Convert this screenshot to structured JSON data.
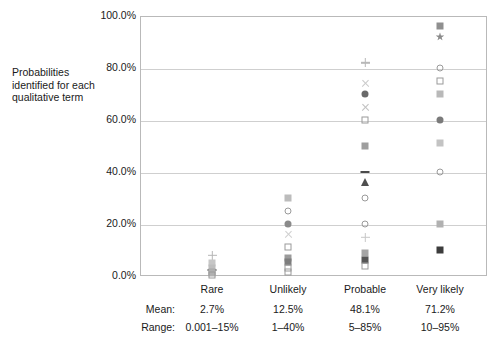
{
  "chart_data": {
    "type": "scatter",
    "title": "",
    "ylabel": "Probabilities identified for each qualitative term",
    "xlabel": "",
    "ylim": [
      0,
      100
    ],
    "yticks": [
      "0.0%",
      "20.0%",
      "40.0%",
      "60.0%",
      "80.0%",
      "100.0%"
    ],
    "ytick_values": [
      0,
      20,
      40,
      60,
      80,
      100
    ],
    "grid": true,
    "legend": "none",
    "categories": [
      "Rare",
      "Unlikely",
      "Probable",
      "Very likely"
    ],
    "series": [
      {
        "name": "Rare",
        "points": [
          {
            "value": 8.0,
            "marker": "plus",
            "color": "#b5b5b5"
          },
          {
            "value": 5.0,
            "marker": "square",
            "color": "#c6c6c6"
          },
          {
            "value": 3.0,
            "marker": "square",
            "color": "#bdbdbd"
          },
          {
            "value": 2.2,
            "marker": "dash",
            "color": "#6f6f6f"
          },
          {
            "value": 1.6,
            "marker": "square",
            "color": "#a8a8a8"
          },
          {
            "value": 1.0,
            "marker": "square",
            "color": "#b0b0b0"
          },
          {
            "value": 0.4,
            "marker": "square-open",
            "color": "#c2c2c2"
          }
        ]
      },
      {
        "name": "Unlikely",
        "points": [
          {
            "value": 30.0,
            "marker": "square",
            "color": "#bcbcbc"
          },
          {
            "value": 25.0,
            "marker": "circle-open",
            "color": "#9d9d9d"
          },
          {
            "value": 20.0,
            "marker": "circle",
            "color": "#8a8a8a"
          },
          {
            "value": 16.0,
            "marker": "ex",
            "color": "#cfcfcf"
          },
          {
            "value": 11.0,
            "marker": "square-open",
            "color": "#c4c4c4"
          },
          {
            "value": 7.0,
            "marker": "square",
            "color": "#9b9b9b"
          },
          {
            "value": 5.5,
            "marker": "square",
            "color": "#7e7e7e"
          },
          {
            "value": 3.0,
            "marker": "square-open",
            "color": "#c9c9c9"
          },
          {
            "value": 1.5,
            "marker": "square-open",
            "color": "#cccccc"
          }
        ]
      },
      {
        "name": "Probable",
        "points": [
          {
            "value": 82.0,
            "marker": "plus",
            "color": "#b8b8b8"
          },
          {
            "value": 74.0,
            "marker": "ex",
            "color": "#cacaca"
          },
          {
            "value": 70.0,
            "marker": "circle",
            "color": "#6a6a6a"
          },
          {
            "value": 65.0,
            "marker": "ex",
            "color": "#c0c0c0"
          },
          {
            "value": 60.0,
            "marker": "square-open",
            "color": "#b4b4b4"
          },
          {
            "value": 50.0,
            "marker": "square",
            "color": "#9e9e9e"
          },
          {
            "value": 40.0,
            "marker": "dash",
            "color": "#4a4a4a"
          },
          {
            "value": 36.0,
            "marker": "triangle",
            "color": "#4f4f4f"
          },
          {
            "value": 30.0,
            "marker": "circle-open",
            "color": "#c5c5c5"
          },
          {
            "value": 20.0,
            "marker": "circle-open",
            "color": "#b2b2b2"
          },
          {
            "value": 15.0,
            "marker": "plus",
            "color": "#c8c8c8"
          },
          {
            "value": 9.0,
            "marker": "square",
            "color": "#a5a5a5"
          },
          {
            "value": 6.0,
            "marker": "square",
            "color": "#555555"
          },
          {
            "value": 4.0,
            "marker": "square-open",
            "color": "#cdcdcd"
          }
        ]
      },
      {
        "name": "Very likely",
        "points": [
          {
            "value": 96.0,
            "marker": "square",
            "color": "#8f8f8f"
          },
          {
            "value": 92.0,
            "marker": "star",
            "color": "#8b8b8b"
          },
          {
            "value": 80.0,
            "marker": "circle-open",
            "color": "#7c7c7c"
          },
          {
            "value": 75.0,
            "marker": "square-open",
            "color": "#b6b6b6"
          },
          {
            "value": 70.0,
            "marker": "square",
            "color": "#b9b9b9"
          },
          {
            "value": 60.0,
            "marker": "circle",
            "color": "#7a7a7a"
          },
          {
            "value": 51.0,
            "marker": "square",
            "color": "#c3c3c3"
          },
          {
            "value": 40.0,
            "marker": "circle-open",
            "color": "#cbcbcb"
          },
          {
            "value": 20.0,
            "marker": "square",
            "color": "#b1b1b1"
          },
          {
            "value": 10.0,
            "marker": "square",
            "color": "#3c3c3c"
          }
        ]
      }
    ],
    "table": {
      "row_labels": [
        "Mean:",
        "Range:"
      ],
      "mean": [
        "2.7%",
        "12.5%",
        "48.1%",
        "71.2%"
      ],
      "range": [
        "0.001–15%",
        "1–40%",
        "5–85%",
        "10–95%"
      ]
    }
  }
}
